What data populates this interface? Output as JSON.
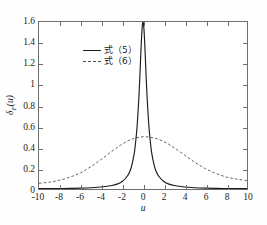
{
  "figure": {
    "top_cut_caption": "",
    "background_color": "#fefefe",
    "frame_color": "#6e6e6e"
  },
  "legend": {
    "position": "upper-left-inside",
    "entries": [
      {
        "label": "式（5）",
        "style": "solid",
        "color": "#1a1a1a"
      },
      {
        "label": "式（6）",
        "style": "dashed",
        "color": "#4d4d4d"
      }
    ]
  },
  "axes": {
    "xlabel": "u",
    "ylabel_symbol": "δ",
    "ylabel_subscript": "F",
    "ylabel_arg": "(u)",
    "xlim": [
      -10,
      10
    ],
    "ylim": [
      0,
      1.6
    ],
    "xticks": [
      -10,
      -8,
      -6,
      -4,
      -2,
      0,
      2,
      4,
      6,
      8,
      10
    ],
    "xticklabels": [
      "-10",
      "-8",
      "-6",
      "-4",
      "-2",
      "0",
      "2",
      "4",
      "6",
      "8",
      "10"
    ],
    "yticks": [
      0,
      0.2,
      0.4,
      0.6,
      0.8,
      1,
      1.2,
      1.4,
      1.6
    ],
    "yticklabels": [
      "0",
      "0.2",
      "0.4",
      "0.6",
      "0.8",
      "1",
      "1.2",
      "1.4",
      "1.6"
    ],
    "grid": false,
    "ticks_all_sides": true
  },
  "chart_data": {
    "type": "line",
    "title": "",
    "xlabel": "u",
    "ylabel": "δF(u)",
    "xlim": [
      -10,
      10
    ],
    "ylim": [
      0,
      1.6
    ],
    "grid": false,
    "legend_position": "upper left",
    "series": [
      {
        "name": "式（5）",
        "style": "solid",
        "color": "#1a1a1a",
        "description": "Narrow sharp peak centred at u=0, maximum 1.6, decays to near 0 by |u|>3",
        "x": [
          -10,
          -9,
          -8,
          -7,
          -6,
          -5,
          -4,
          -3,
          -2.5,
          -2,
          -1.5,
          -1.2,
          -1,
          -0.8,
          -0.6,
          -0.5,
          -0.4,
          -0.3,
          -0.2,
          -0.15,
          -0.1,
          -0.05,
          0,
          0.05,
          0.1,
          0.15,
          0.2,
          0.3,
          0.4,
          0.5,
          0.6,
          0.8,
          1,
          1.2,
          1.5,
          2,
          2.5,
          3,
          4,
          5,
          6,
          7,
          8,
          9,
          10
        ],
        "y": [
          0.003,
          0.004,
          0.005,
          0.006,
          0.008,
          0.012,
          0.019,
          0.033,
          0.047,
          0.072,
          0.125,
          0.185,
          0.26,
          0.37,
          0.56,
          0.7,
          0.87,
          1.08,
          1.32,
          1.43,
          1.52,
          1.58,
          1.6,
          1.58,
          1.52,
          1.43,
          1.32,
          1.08,
          0.87,
          0.7,
          0.56,
          0.37,
          0.26,
          0.185,
          0.125,
          0.072,
          0.047,
          0.033,
          0.019,
          0.012,
          0.008,
          0.006,
          0.005,
          0.004,
          0.003
        ]
      },
      {
        "name": "式（6）",
        "style": "dashed",
        "color": "#4d4d4d",
        "description": "Broad bell-shaped curve centred at u=0, maximum about 0.50, tails about 0.05-0.08 at |u|=10",
        "x": [
          -10,
          -9,
          -8,
          -7,
          -6,
          -5,
          -4,
          -3,
          -2,
          -1,
          0,
          1,
          2,
          3,
          4,
          5,
          6,
          7,
          8,
          9,
          10
        ],
        "y": [
          0.055,
          0.065,
          0.085,
          0.115,
          0.155,
          0.215,
          0.285,
          0.36,
          0.43,
          0.48,
          0.5,
          0.49,
          0.455,
          0.395,
          0.325,
          0.255,
          0.195,
          0.15,
          0.115,
          0.095,
          0.08
        ]
      }
    ]
  }
}
